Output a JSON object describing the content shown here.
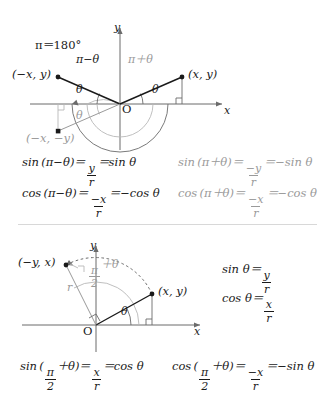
{
  "figure": {
    "type": "geometry-diagram",
    "topic": "Trigonometric identities on the unit circle",
    "panels": [
      {
        "id": "panel-upper",
        "note_pi_degrees": "π＝180°",
        "axis_x_label": "x",
        "axis_y_label": "y",
        "origin_label": "O",
        "points": [
          {
            "name": "point-minus-x-y",
            "label": "(−x, y)",
            "color": "#1a1a1a"
          },
          {
            "name": "point-x-y",
            "label": "(x, y)",
            "color": "#1a1a1a"
          },
          {
            "name": "point-minus-x-minus-y",
            "label": "(−x, −y)",
            "color": "#9a9a9a"
          }
        ],
        "angles": [
          {
            "name": "angle-pi-minus-theta",
            "label": "π−θ",
            "color": "#1a1a1a"
          },
          {
            "name": "angle-pi-plus-theta",
            "label": "π＋θ",
            "color": "#9a9a9a"
          },
          {
            "name": "angle-theta-left",
            "label": "θ",
            "color": "#1a1a1a"
          },
          {
            "name": "angle-theta-right",
            "label": "θ",
            "color": "#1a1a1a"
          },
          {
            "name": "angle-theta-below",
            "label": "θ",
            "color": "#9a9a9a"
          }
        ]
      },
      {
        "id": "panel-lower",
        "axis_x_label": "x",
        "axis_y_label": "y",
        "origin_label": "O",
        "radius_label": "r",
        "points": [
          {
            "name": "point-minus-y-x",
            "label": "(−y, x)",
            "color": "#1a1a1a"
          },
          {
            "name": "point-x-y",
            "label": "(x, y)",
            "color": "#1a1a1a"
          }
        ],
        "angles": [
          {
            "name": "angle-half-pi-plus-theta",
            "label_num": "π",
            "label_den": "2",
            "label_tail": "＋θ",
            "color": "#9a9a9a"
          },
          {
            "name": "angle-theta",
            "label": "θ",
            "color": "#1a1a1a"
          }
        ]
      }
    ]
  },
  "equations": {
    "upper_row1_left": {
      "name": "eq-sin-pi-minus-theta",
      "lhs": "sin (π−θ)＝",
      "num": "y",
      "den": "r",
      "rhs": "＝sin θ",
      "color": "#1a1a1a"
    },
    "upper_row1_right": {
      "name": "eq-sin-pi-plus-theta",
      "lhs": "sin (π＋θ)＝",
      "num": "−y",
      "den": "r",
      "rhs": "＝−sin θ",
      "color": "#9a9a9a"
    },
    "upper_row2_left": {
      "name": "eq-cos-pi-minus-theta",
      "lhs": "cos (π−θ)＝",
      "num": "−x",
      "den": "r",
      "rhs": "＝−cos θ",
      "color": "#1a1a1a"
    },
    "upper_row2_right": {
      "name": "eq-cos-pi-plus-theta",
      "lhs": "cos (π＋θ)＝",
      "num": "−x",
      "den": "r",
      "rhs": "＝−cos θ",
      "color": "#9a9a9a"
    },
    "lower_side_sin": {
      "name": "eq-sin-theta",
      "lhs": "sin θ＝",
      "num": "y",
      "den": "r",
      "rhs": "",
      "color": "#1a1a1a"
    },
    "lower_side_cos": {
      "name": "eq-cos-theta",
      "lhs": "cos θ＝",
      "num": "x",
      "den": "r",
      "rhs": "",
      "color": "#1a1a1a"
    },
    "lower_row_left": {
      "name": "eq-sin-half-pi-plus-theta",
      "lhs_open": "sin (",
      "inner_num": "π",
      "inner_den": "2",
      "inner_tail": "＋θ",
      "lhs_close": ")＝",
      "num": "x",
      "den": "r",
      "rhs": "＝cos θ",
      "color": "#1a1a1a"
    },
    "lower_row_right": {
      "name": "eq-cos-half-pi-plus-theta",
      "lhs_open": "cos (",
      "inner_num": "π",
      "inner_den": "2",
      "inner_tail": "＋θ",
      "lhs_close": ")＝",
      "num": "−x",
      "den": "r",
      "rhs": "＝−sin θ",
      "color": "#1a1a1a"
    }
  },
  "colors": {
    "ink": "#1a1a1a",
    "gray": "#9a9a9a",
    "axis": "#6b6b6b",
    "light_gray": "#b8b8b8"
  }
}
